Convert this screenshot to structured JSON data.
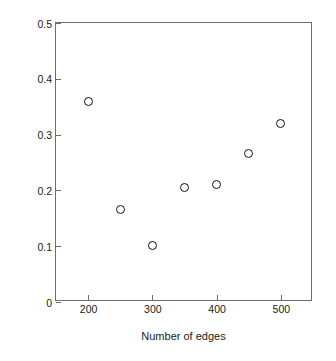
{
  "chart_data": {
    "type": "scatter",
    "title": "",
    "xlabel": "Number of edges",
    "ylabel": "Correlation between IQ and modularity",
    "xlim": [
      150,
      550
    ],
    "ylim": [
      0,
      0.5
    ],
    "grid": false,
    "legend": null,
    "xticks": [
      200,
      300,
      400,
      500
    ],
    "xtick_labels": [
      "200",
      "300",
      "400",
      "500"
    ],
    "yticks": [
      0,
      0.1,
      0.2,
      0.3,
      0.4,
      0.5
    ],
    "ytick_labels": [
      "0",
      "0.1",
      "0.2",
      "0.3",
      "0.4",
      "0.5"
    ],
    "marker": "open-circle",
    "marker_color": "#111111",
    "x": [
      200,
      250,
      300,
      350,
      400,
      450,
      500
    ],
    "y": [
      0.36,
      0.165,
      0.102,
      0.206,
      0.21,
      0.266,
      0.32
    ],
    "points": [
      {
        "x": 200,
        "y": 0.36
      },
      {
        "x": 250,
        "y": 0.165
      },
      {
        "x": 300,
        "y": 0.102
      },
      {
        "x": 350,
        "y": 0.206
      },
      {
        "x": 400,
        "y": 0.21
      },
      {
        "x": 450,
        "y": 0.266
      },
      {
        "x": 500,
        "y": 0.32
      }
    ]
  },
  "style": {
    "axis_color": "#6d6d6d",
    "text_color": "#1a1a1a",
    "background": "#ffffff"
  }
}
